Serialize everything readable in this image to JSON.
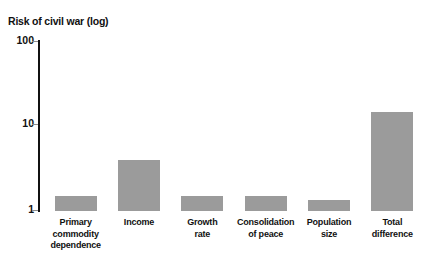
{
  "chart_data": {
    "type": "bar",
    "title": "Risk of civil war (log)",
    "xlabel": "",
    "ylabel": "Risk of civil war (log)",
    "yscale": "log",
    "ylim": [
      1,
      100
    ],
    "ytick_labels": [
      "100",
      "10",
      "1"
    ],
    "ytick_values": [
      100,
      10,
      1
    ],
    "grid": false,
    "legend": false,
    "bar_color": "#9b9b9b",
    "categories": [
      "Primary commodity dependence",
      "Income",
      "Growth rate",
      "Consolidation of peace",
      "Population size",
      "Total difference"
    ],
    "category_lines": [
      [
        "Primary",
        "commodity",
        "dependence"
      ],
      [
        "Income"
      ],
      [
        "Growth",
        "rate"
      ],
      [
        "Consolidation",
        "of peace"
      ],
      [
        "Population",
        "size"
      ],
      [
        "Total",
        "difference"
      ]
    ],
    "values": [
      1.5,
      3.9,
      1.5,
      1.5,
      1.35,
      14
    ]
  },
  "axis": {
    "tick_100": "100",
    "tick_10": "10",
    "tick_1": "1"
  }
}
